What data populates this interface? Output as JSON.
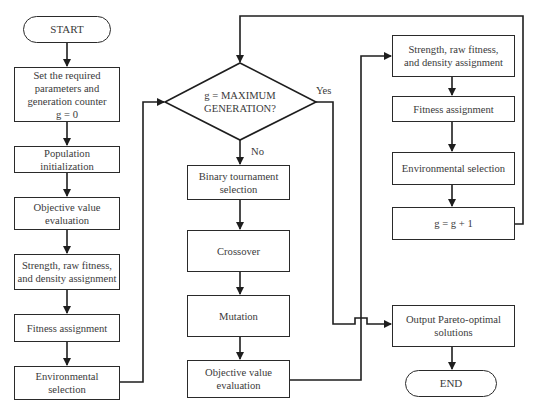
{
  "diagram": {
    "type": "flowchart",
    "colors": {
      "stroke": "#2a2a2a",
      "text": "#3a3a3a",
      "background": "#ffffff"
    },
    "nodes": {
      "start": {
        "label": "START",
        "shape": "terminal"
      },
      "init_params": {
        "label": "Set the required\nparameters and\ngeneration counter\ng = 0",
        "shape": "process"
      },
      "pop_init": {
        "label": "Population initialization",
        "shape": "process"
      },
      "obj_eval_1": {
        "label": "Objective value\nevaluation",
        "shape": "process"
      },
      "strength_1": {
        "label": "Strength, raw fitness,\nand density assignment",
        "shape": "process"
      },
      "fitness_1": {
        "label": "Fitness assignment",
        "shape": "process"
      },
      "env_sel_1": {
        "label": "Environmental\nselection",
        "shape": "process"
      },
      "decision": {
        "label": "g = MAXIMUM\nGENERATION?",
        "shape": "decision"
      },
      "binary_tournament": {
        "label": "Binary tournament\nselection",
        "shape": "process"
      },
      "crossover": {
        "label": "Crossover",
        "shape": "process"
      },
      "mutation": {
        "label": "Mutation",
        "shape": "process"
      },
      "obj_eval_2": {
        "label": "Objective value\nevaluation",
        "shape": "process"
      },
      "strength_2": {
        "label": "Strength, raw fitness,\nand density assignment",
        "shape": "process"
      },
      "fitness_2": {
        "label": "Fitness assignment",
        "shape": "process"
      },
      "env_sel_2": {
        "label": "Environmental selection",
        "shape": "process"
      },
      "increment": {
        "label": "g = g + 1",
        "shape": "process"
      },
      "output": {
        "label": "Output Pareto-optimal\nsolutions",
        "shape": "process"
      },
      "end": {
        "label": "END",
        "shape": "terminal"
      }
    },
    "edge_labels": {
      "yes": "Yes",
      "no": "No"
    },
    "edges": [
      {
        "from": "start",
        "to": "init_params"
      },
      {
        "from": "init_params",
        "to": "pop_init"
      },
      {
        "from": "pop_init",
        "to": "obj_eval_1"
      },
      {
        "from": "obj_eval_1",
        "to": "strength_1"
      },
      {
        "from": "strength_1",
        "to": "fitness_1"
      },
      {
        "from": "fitness_1",
        "to": "env_sel_1"
      },
      {
        "from": "env_sel_1",
        "to": "decision"
      },
      {
        "from": "decision",
        "to": "binary_tournament",
        "label": "No"
      },
      {
        "from": "decision",
        "to": "output",
        "label": "Yes"
      },
      {
        "from": "binary_tournament",
        "to": "crossover"
      },
      {
        "from": "crossover",
        "to": "mutation"
      },
      {
        "from": "mutation",
        "to": "obj_eval_2"
      },
      {
        "from": "obj_eval_2",
        "to": "strength_2"
      },
      {
        "from": "strength_2",
        "to": "fitness_2"
      },
      {
        "from": "fitness_2",
        "to": "env_sel_2"
      },
      {
        "from": "env_sel_2",
        "to": "increment"
      },
      {
        "from": "increment",
        "to": "decision"
      },
      {
        "from": "output",
        "to": "end"
      }
    ]
  }
}
